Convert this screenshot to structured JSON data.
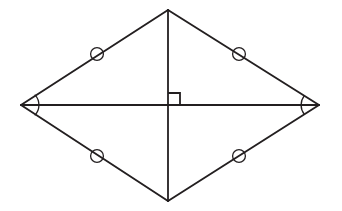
{
  "figure": {
    "background_color": "#ffffff",
    "stroke_color": "#231f20",
    "canvas": {
      "width": 342,
      "height": 211
    }
  },
  "vertices": {
    "top": {
      "name": "top-vertex",
      "x": 168,
      "y": 10
    },
    "right": {
      "name": "right-vertex",
      "x": 319,
      "y": 105
    },
    "bottom": {
      "name": "bottom-vertex",
      "x": 168,
      "y": 201
    },
    "left": {
      "name": "left-vertex",
      "x": 21,
      "y": 105
    }
  },
  "intersection": {
    "name": "diagonal-intersection",
    "x": 168,
    "y": 105
  },
  "edges": [
    {
      "name": "edge-top-left",
      "x1": 21,
      "y1": 105,
      "x2": 168,
      "y2": 10,
      "stroke_width": 1.9
    },
    {
      "name": "edge-top-right",
      "x1": 168,
      "y1": 10,
      "x2": 319,
      "y2": 105,
      "stroke_width": 1.9
    },
    {
      "name": "edge-bottom-right",
      "x1": 319,
      "y1": 105,
      "x2": 168,
      "y2": 201,
      "stroke_width": 1.9
    },
    {
      "name": "edge-bottom-left",
      "x1": 168,
      "y1": 201,
      "x2": 21,
      "y2": 105,
      "stroke_width": 1.9
    }
  ],
  "diagonals": [
    {
      "name": "diagonal-horizontal",
      "x1": 21,
      "y1": 105,
      "x2": 319,
      "y2": 105,
      "stroke_width": 1.8
    },
    {
      "name": "diagonal-vertical",
      "x1": 168,
      "y1": 10,
      "x2": 168,
      "y2": 201,
      "stroke_width": 1.8
    }
  ],
  "tick_marks": [
    {
      "name": "tick-circle-top-left",
      "cx": 97,
      "cy": 54,
      "r": 6.4,
      "stroke_width": 1.3
    },
    {
      "name": "tick-circle-top-right",
      "cx": 239,
      "cy": 54,
      "r": 6.4,
      "stroke_width": 1.3
    },
    {
      "name": "tick-circle-bottom-left",
      "cx": 97,
      "cy": 156,
      "r": 6.4,
      "stroke_width": 1.3
    },
    {
      "name": "tick-circle-bottom-right",
      "cx": 239,
      "cy": 156,
      "r": 6.4,
      "stroke_width": 1.3
    }
  ],
  "angle_arcs": [
    {
      "name": "angle-arc-left",
      "path": "M 35.2 95.1 A 15 15 0 0 1 35.2 114.9",
      "stroke_width": 1.3
    },
    {
      "name": "angle-arc-right",
      "path": "M 304.4 95.6 A 15 15 0 0 0 304.4 114.4",
      "stroke_width": 1.3
    }
  ],
  "right_angle": {
    "name": "right-angle-mark",
    "path": "M 168 93 L 180 93 L 180 105",
    "size": 12,
    "stroke_width": 1.8,
    "quadrant": "upper-right"
  }
}
